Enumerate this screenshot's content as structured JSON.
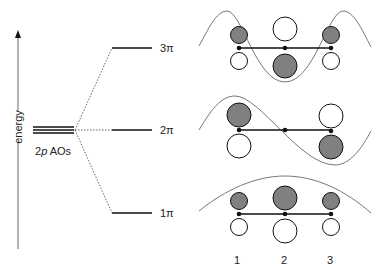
{
  "diagram": {
    "axis_label": "energy",
    "ao_label_prefix": "2",
    "ao_label_italic": "p",
    "ao_label_suffix": " AOs",
    "levels": [
      {
        "name": "3π",
        "y": 48
      },
      {
        "name": "2π",
        "y": 130
      },
      {
        "name": "1π",
        "y": 213
      }
    ],
    "atom_labels": [
      "1",
      "2",
      "3"
    ],
    "colors": {
      "shaded_lobe": "#808080",
      "empty_lobe": "#ffffff",
      "outline": "#111111",
      "wave_curve": "#777777"
    }
  }
}
